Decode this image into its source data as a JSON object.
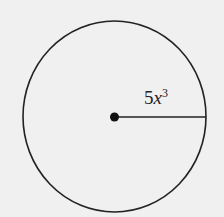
{
  "diagram": {
    "shape": "circle",
    "center": {
      "x": 114.5,
      "y": 116.5
    },
    "radius_px": {
      "rx": 91.5,
      "ry": 95.5
    },
    "radius_label": {
      "coefficient": "5",
      "variable": "x",
      "exponent": "3"
    },
    "colors": {
      "background": "#f0f0f0",
      "stroke": "#222222"
    }
  }
}
